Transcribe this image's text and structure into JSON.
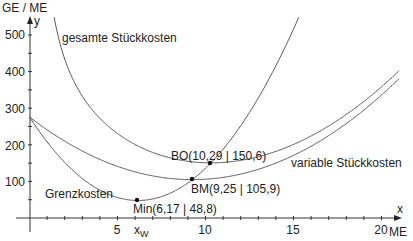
{
  "chart_data": {
    "type": "line",
    "title": "",
    "xlabel": "ME",
    "xvar": "x",
    "ylabel": "GE / ME",
    "yvar": "y",
    "xlim": [
      0,
      21
    ],
    "ylim": [
      0,
      540
    ],
    "xticks": [
      5,
      10,
      15,
      20
    ],
    "yticks": [
      100,
      200,
      300,
      400,
      500
    ],
    "grid": false,
    "series": [
      {
        "name": "gesamte Stückkosten",
        "formula": "2x^2 - 37x + 276 + 449/x",
        "x_range": [
          0.9,
          21
        ]
      },
      {
        "name": "variable Stückkosten",
        "formula": "2x^2 - 37x + 276",
        "x_range": [
          0,
          21
        ]
      },
      {
        "name": "Grenzkosten",
        "formula": "6x^2 - 74x + 276",
        "x_range": [
          0,
          15.3
        ]
      }
    ],
    "points": [
      {
        "label": "BO(10,29 | 150,6)",
        "x": 10.29,
        "y": 150.6
      },
      {
        "label": "BM(9,25 | 105,9)",
        "x": 9.25,
        "y": 105.9
      },
      {
        "label": "Min(6,17 | 48,8)",
        "x": 6.17,
        "y": 48.8
      }
    ],
    "annotations": [
      {
        "text": "gesamte Stückkosten"
      },
      {
        "text": "variable Stückkosten"
      },
      {
        "text": "Grenzkosten"
      },
      {
        "text": "x",
        "subscript": "W"
      }
    ]
  },
  "labels": {
    "y_unit": "GE / ME",
    "y_var": "y",
    "x_var": "x",
    "x_unit": "ME",
    "tick_5": "5",
    "tick_10": "10",
    "tick_15": "15",
    "tick_20": "20",
    "tick_100": "100",
    "tick_200": "200",
    "tick_300": "300",
    "tick_400": "400",
    "tick_500": "500",
    "gesamte": "gesamte Stückkosten",
    "variable": "variable Stückkosten",
    "grenz": "Grenzkosten",
    "bo": "BO(10,29 | 150,6)",
    "bm": "BM(9,25 | 105,9)",
    "min": "Min(6,17 | 48,8)",
    "xw_main": "x",
    "xw_sub": "W"
  }
}
